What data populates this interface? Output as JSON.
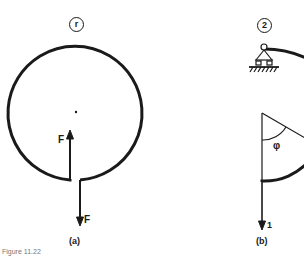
{
  "figure": {
    "caption": "Figure 11.22",
    "panels": [
      {
        "id": "a",
        "label": "(a)",
        "marker": "r",
        "force_labels": [
          "F",
          "F"
        ]
      },
      {
        "id": "b",
        "label": "(b)",
        "marker": "2",
        "angle_label": "φ",
        "load_label": "1"
      }
    ]
  },
  "colors": {
    "stroke": "#1a1a1a",
    "background": "#ffffff"
  }
}
